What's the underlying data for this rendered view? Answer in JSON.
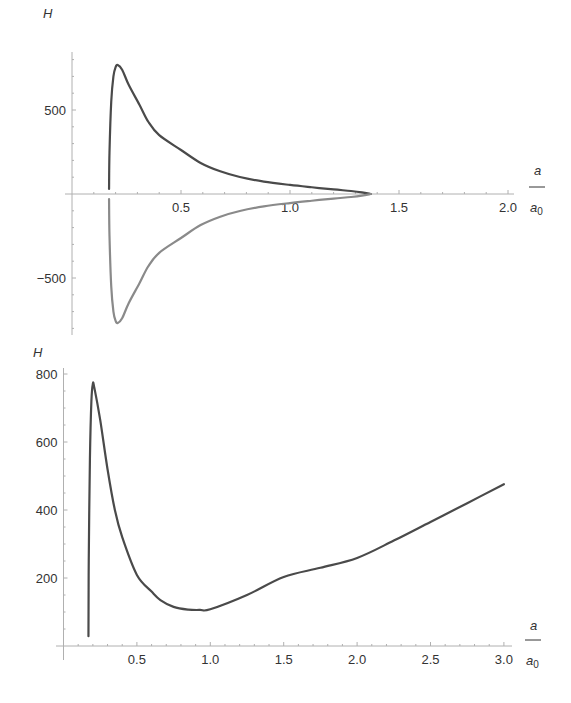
{
  "chart_data": [
    {
      "type": "line",
      "title": "",
      "xlabel": "a / a0",
      "ylabel": "H",
      "xlim": [
        0,
        2.05
      ],
      "ylim": [
        -850,
        850
      ],
      "grid": false,
      "legend": "none",
      "x_ticks": [
        0.5,
        1.0,
        1.5,
        2.0
      ],
      "x_tick_labels": [
        "0.5",
        "1.0",
        "1.5",
        "2.0"
      ],
      "y_ticks": [
        500,
        -500
      ],
      "y_tick_labels": [
        "500",
        "−500"
      ],
      "series": [
        {
          "name": "upper branch",
          "color": "#4a4a4a",
          "x": [
            0.17,
            0.172,
            0.18,
            0.19,
            0.2,
            0.21,
            0.23,
            0.26,
            0.31,
            0.35,
            0.4,
            0.5,
            0.59,
            0.68,
            0.77,
            0.88,
            1.0,
            1.1,
            1.2,
            1.28,
            1.33,
            1.37
          ],
          "y": [
            30,
            250,
            550,
            700,
            755,
            768,
            740,
            650,
            530,
            430,
            350,
            262,
            185,
            135,
            101,
            74,
            54,
            40,
            27,
            18,
            10,
            0
          ]
        },
        {
          "name": "lower branch",
          "color": "#8a8a8a",
          "x": [
            0.17,
            0.172,
            0.18,
            0.19,
            0.2,
            0.21,
            0.23,
            0.26,
            0.31,
            0.35,
            0.4,
            0.5,
            0.59,
            0.68,
            0.77,
            0.88,
            1.0,
            1.1,
            1.2,
            1.28,
            1.33,
            1.37
          ],
          "y": [
            -30,
            -250,
            -550,
            -700,
            -755,
            -768,
            -740,
            -650,
            -530,
            -430,
            -350,
            -262,
            -185,
            -135,
            -101,
            -74,
            -54,
            -40,
            -27,
            -18,
            -10,
            0
          ]
        }
      ]
    },
    {
      "type": "line",
      "title": "",
      "xlabel": "a / a0",
      "ylabel": "H",
      "xlim": [
        0,
        3.05
      ],
      "ylim": [
        0,
        820
      ],
      "grid": false,
      "legend": "none",
      "x_ticks": [
        0.5,
        1.0,
        1.5,
        2.0,
        2.5,
        3.0
      ],
      "x_tick_labels": [
        "0.5",
        "1.0",
        "1.5",
        "2.0",
        "2.5",
        "3.0"
      ],
      "y_ticks": [
        200,
        400,
        600,
        800
      ],
      "y_tick_labels": [
        "200",
        "400",
        "600",
        "800"
      ],
      "series": [
        {
          "name": "H",
          "color": "#4a4a4a",
          "x": [
            0.17,
            0.172,
            0.18,
            0.19,
            0.2,
            0.21,
            0.25,
            0.3,
            0.35,
            0.4,
            0.5,
            0.6,
            0.66,
            0.75,
            0.85,
            0.93,
            1.0,
            1.25,
            1.5,
            1.75,
            2.0,
            2.25,
            2.5,
            2.75,
            3.0
          ],
          "y": [
            29,
            250,
            550,
            720,
            771,
            760,
            665,
            520,
            400,
            320,
            209,
            160,
            135,
            115,
            107,
            106,
            108,
            150,
            203,
            230,
            259,
            310,
            365,
            420,
            476
          ]
        }
      ]
    }
  ],
  "labels": {
    "top": {
      "y_axis": "H",
      "x_num": "a",
      "x_den": "a",
      "x_den_sub": "0"
    },
    "bottom": {
      "y_axis": "H",
      "x_num": "a",
      "x_den": "a",
      "x_den_sub": "0"
    }
  }
}
